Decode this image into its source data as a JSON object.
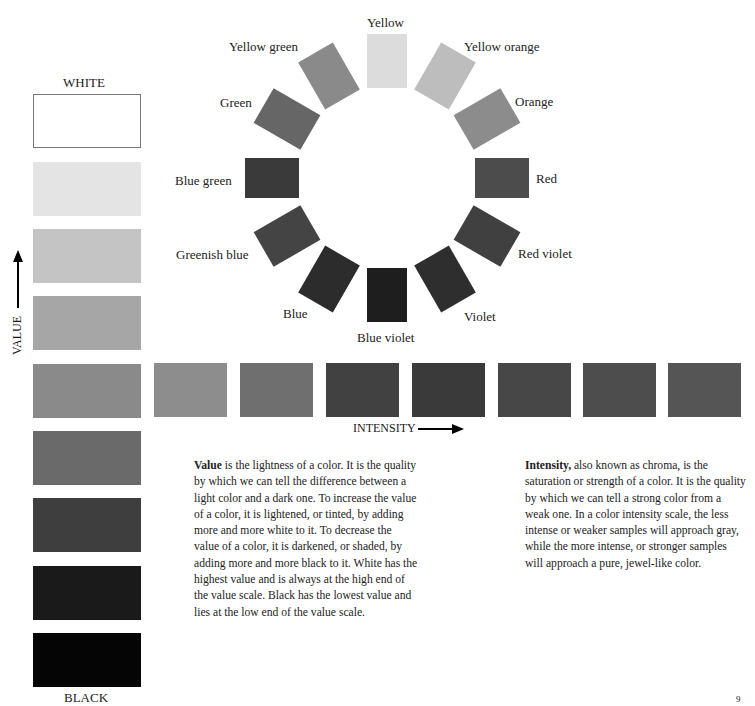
{
  "value_scale": {
    "top_label": "WHITE",
    "bottom_label": "BLACK",
    "axis_label": "VALUE",
    "swatches": [
      {
        "color": "#ffffff"
      },
      {
        "color": "#e4e4e4"
      },
      {
        "color": "#c4c4c4"
      },
      {
        "color": "#a6a6a6"
      },
      {
        "color": "#8a8a8a"
      },
      {
        "color": "#6a6a6a"
      },
      {
        "color": "#3e3e3e"
      },
      {
        "color": "#1a1a1a"
      },
      {
        "color": "#050505"
      }
    ]
  },
  "intensity_scale": {
    "axis_label": "INTENSITY",
    "swatches": [
      {
        "color": "#8d8d8d"
      },
      {
        "color": "#6f6f6f"
      },
      {
        "color": "#414141"
      },
      {
        "color": "#3a3a3a"
      },
      {
        "color": "#474747"
      },
      {
        "color": "#4d4d4d"
      },
      {
        "color": "#555555"
      }
    ]
  },
  "color_wheel": {
    "items": [
      {
        "label": "Yellow",
        "color": "#dcdcdc"
      },
      {
        "label": "Yellow orange",
        "color": "#bdbdbd"
      },
      {
        "label": "Orange",
        "color": "#8c8c8c"
      },
      {
        "label": "Red",
        "color": "#4c4c4c"
      },
      {
        "label": "Red violet",
        "color": "#404040"
      },
      {
        "label": "Violet",
        "color": "#2e2e2e"
      },
      {
        "label": "Blue violet",
        "color": "#1e1e1e"
      },
      {
        "label": "Blue",
        "color": "#2c2c2c"
      },
      {
        "label": "Greenish blue",
        "color": "#444444"
      },
      {
        "label": "Blue green",
        "color": "#3a3a3a"
      },
      {
        "label": "Green",
        "color": "#666666"
      },
      {
        "label": "Yellow green",
        "color": "#8a8a8a"
      }
    ]
  },
  "text": {
    "value_term": "Value",
    "value_body": " is the lightness of a color. It is the quality by which we can tell the difference between a light color and a dark one. To increase the value of a color, it is lightened, or tinted, by adding more and more white to it. To decrease the value of a color, it is darkened, or shaded, by adding more and more black to it. White has the highest value and is always at the high end of the value scale. Black has the lowest value and lies at the low end of the value scale.",
    "intensity_term": "Intensity,",
    "intensity_body": " also known as chroma, is the saturation or strength of a color. It is the quality by which we can tell a strong color from a weak one. In a color intensity scale, the less intense or weaker samples will approach gray, while the more intense, or stronger samples will approach a pure, jewel-like color."
  },
  "page_number": "9"
}
